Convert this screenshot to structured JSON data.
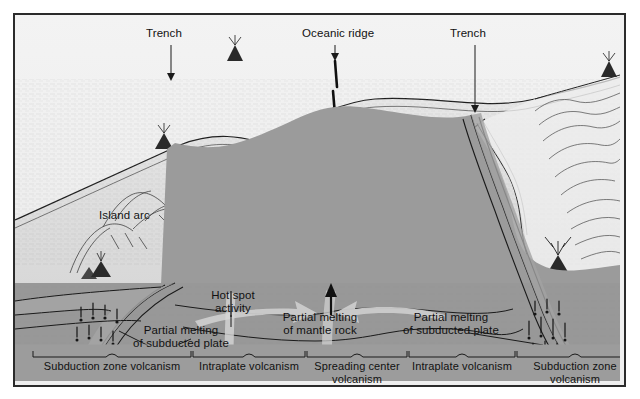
{
  "figure": {
    "kind": "geology-cross-section",
    "frame_border_color": "#2b2b2b",
    "palette": {
      "sky_water": "#efefef",
      "ocean_floor": "#e4e4e4",
      "lithosphere": "#9a9a9a",
      "asthenosphere": "#8d8d8d",
      "deep_mantle": "#909090",
      "ink": "#1a1a1a",
      "label_band": "#9c9c9c",
      "flow_arrow": "#cfcfcf",
      "magma_plume": "#c8c8c8"
    }
  },
  "callouts": {
    "trench_left": "Trench",
    "oceanic_ridge": "Oceanic ridge",
    "trench_right": "Trench",
    "island_arc": "Island arc",
    "hot_spot": [
      "Hot spot",
      "activity"
    ],
    "partial_melting_subducted_left": [
      "Partial melting",
      "of subducted plate"
    ],
    "partial_melting_mantle": [
      "Partial melting",
      "of mantle rock"
    ],
    "partial_melting_subducted_right": [
      "Partial melting",
      "of subducted plate"
    ]
  },
  "zones": [
    {
      "id": "subduction-left",
      "lines": [
        "Subduction zone volcanism"
      ],
      "bracket": {
        "x1": 18,
        "x2": 176
      }
    },
    {
      "id": "intraplate-left",
      "lines": [
        "Intraplate volcanism"
      ],
      "bracket": {
        "x1": 178,
        "x2": 290
      }
    },
    {
      "id": "spreading-center",
      "lines": [
        "Spreading center",
        "volcanism"
      ],
      "bracket": {
        "x1": 292,
        "x2": 392
      }
    },
    {
      "id": "intraplate-right",
      "lines": [
        "Intraplate volcanism"
      ],
      "bracket": {
        "x1": 394,
        "x2": 500
      }
    },
    {
      "id": "subduction-right",
      "lines": [
        "Subduction zone",
        "volcanism"
      ],
      "bracket": {
        "x1": 502,
        "x2": 618
      }
    }
  ]
}
